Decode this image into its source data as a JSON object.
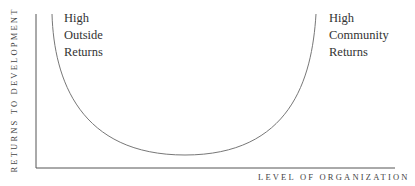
{
  "diagram": {
    "type": "u-curve",
    "y_axis_label": "RETURNS TO DEVELOPMENT",
    "x_axis_label": "LEVEL OF ORGANIZATION",
    "left_annotation": [
      "High",
      "Outside",
      "Returns"
    ],
    "right_annotation": [
      "High",
      "Community",
      "Returns"
    ],
    "colors": {
      "axis": "#555555",
      "curve": "#777777",
      "text": "#333333"
    }
  }
}
